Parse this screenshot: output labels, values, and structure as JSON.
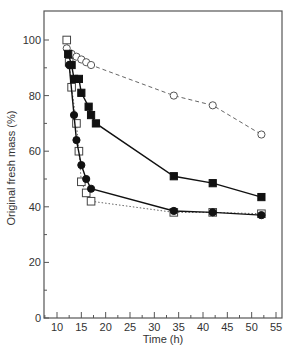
{
  "chart_data": {
    "type": "line",
    "title": "",
    "xlabel": "Time (h)",
    "ylabel": "Original fresh mass (%)",
    "xlim": [
      7,
      56
    ],
    "ylim": [
      0,
      108
    ],
    "xticks": [
      10,
      15,
      20,
      25,
      30,
      35,
      40,
      45,
      50,
      55
    ],
    "yticks": [
      0,
      20,
      40,
      60,
      80,
      100
    ],
    "grid": false,
    "legend": null,
    "series": [
      {
        "name": "open-circles",
        "marker": "open-circle",
        "line": "dashed",
        "x": [
          12,
          13,
          14,
          15,
          16,
          17,
          34,
          42,
          52
        ],
        "y": [
          97,
          95,
          94,
          93,
          92,
          91,
          80,
          76.5,
          66
        ]
      },
      {
        "name": "filled-squares",
        "marker": "filled-square",
        "line": "solid",
        "x": [
          12.3,
          13,
          13.5,
          14.5,
          15,
          16.5,
          17,
          18,
          34,
          42,
          52
        ],
        "y": [
          95,
          91,
          86,
          86,
          81,
          76,
          73,
          70,
          51,
          48.5,
          43.5
        ]
      },
      {
        "name": "filled-circles",
        "marker": "filled-circle",
        "line": "solid",
        "x": [
          12.5,
          13.5,
          14,
          15,
          16,
          17,
          34,
          42,
          52
        ],
        "y": [
          91,
          73,
          64,
          55,
          50,
          46.5,
          38.5,
          38,
          37
        ]
      },
      {
        "name": "open-squares",
        "marker": "open-square",
        "line": "dotted",
        "x": [
          12,
          12.5,
          13,
          14,
          14.5,
          15,
          16,
          17,
          34,
          42,
          52
        ],
        "y": [
          100,
          92,
          83,
          70,
          60,
          49,
          45,
          42,
          38,
          38,
          37.5
        ]
      }
    ]
  }
}
